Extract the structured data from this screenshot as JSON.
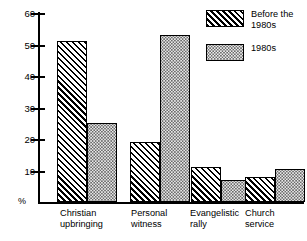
{
  "chart_data": {
    "type": "bar",
    "title": "",
    "subtitle": "",
    "xlabel": "",
    "ylabel": "%",
    "ylim": [
      0,
      60
    ],
    "ytick_values": [
      60,
      50,
      40,
      30,
      20,
      10
    ],
    "ytick_labels": [
      "60",
      "50",
      "40",
      "30",
      "20",
      "10"
    ],
    "grid": false,
    "legend_position": "top-right",
    "categories": [
      "Christian\nupbringing",
      "Personal\nwitness",
      "Evangelistic\nrally",
      "Church\nservice"
    ],
    "series": [
      {
        "name": "Before the\n1980s",
        "pattern": "diagonal-hatch",
        "values": [
          51,
          19,
          11,
          8
        ]
      },
      {
        "name": "1980s",
        "pattern": "dotted",
        "values": [
          25,
          53,
          7,
          10.5
        ]
      }
    ]
  },
  "axis": {
    "percent_symbol": "%"
  },
  "colors": {
    "ink": "#000000",
    "background": "#ffffff",
    "dot_fill": "#e9e9e9",
    "dot_ink": "#6a6a6a"
  }
}
